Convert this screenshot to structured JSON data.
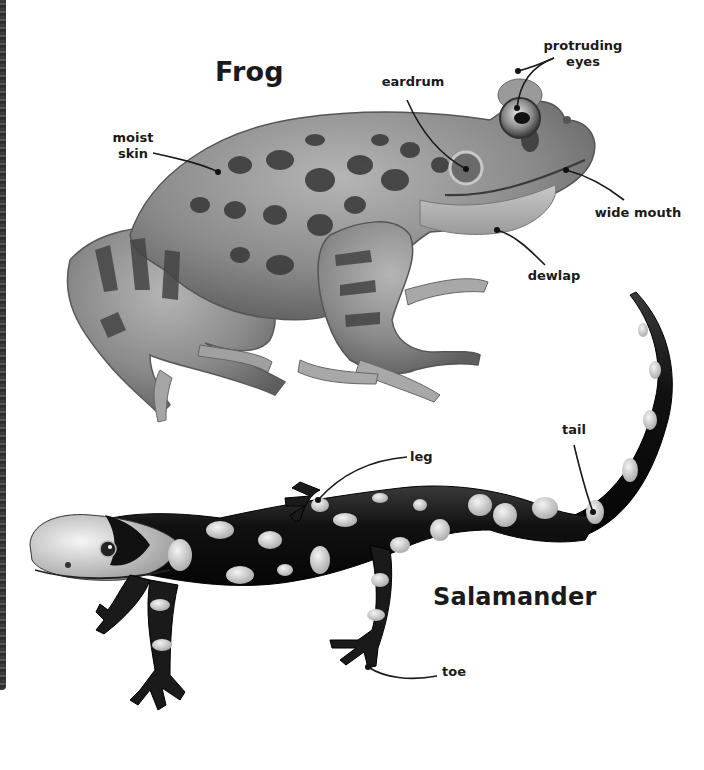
{
  "frog": {
    "title": "Frog",
    "labels": {
      "moist_skin": [
        "moist",
        "skin"
      ],
      "eardrum": "eardrum",
      "protruding_eyes": [
        "protruding",
        "eyes"
      ],
      "wide_mouth": "wide mouth",
      "dewlap": "dewlap"
    }
  },
  "salamander": {
    "title": "Salamander",
    "labels": {
      "leg": "leg",
      "tail": "tail",
      "toe": "toe"
    }
  },
  "colors": {
    "background": "#ffffff",
    "text": "#1a1a1a",
    "frog_skin": "#8f8f8f",
    "frog_spots": "#3c3c3c",
    "salamander_body": "#141414",
    "salamander_spots": "#d9d9d9"
  }
}
